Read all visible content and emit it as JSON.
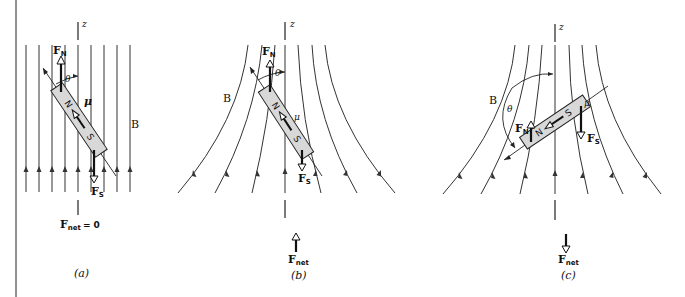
{
  "figure": {
    "panels": [
      {
        "id": "a",
        "caption": "(a)",
        "axis_label": "z",
        "field_label": "B",
        "moment_label": "μ",
        "angle_label": "θ",
        "north_label": "N",
        "south_label": "S",
        "force_north": {
          "main": "F",
          "sub": "N"
        },
        "force_south": {
          "main": "F",
          "sub": "S"
        },
        "net_force": {
          "main": "F",
          "sub": "net",
          "suffix": "= 0"
        },
        "field_type": "uniform"
      },
      {
        "id": "b",
        "caption": "(b)",
        "axis_label": "z",
        "field_label": "B",
        "moment_label": "μ",
        "angle_label": "θ",
        "north_label": "N",
        "south_label": "S",
        "force_north": {
          "main": "F",
          "sub": "N"
        },
        "force_south": {
          "main": "F",
          "sub": "S"
        },
        "net_force": {
          "main": "F",
          "sub": "net",
          "direction": "up"
        },
        "field_type": "diverging"
      },
      {
        "id": "c",
        "caption": "(c)",
        "axis_label": "z",
        "field_label": "B",
        "moment_label": "μ",
        "angle_label": "θ",
        "north_label": "N",
        "south_label": "S",
        "force_north": {
          "main": "F",
          "sub": "N"
        },
        "force_south": {
          "main": "F",
          "sub": "S"
        },
        "net_force": {
          "main": "F",
          "sub": "net",
          "direction": "down"
        },
        "field_type": "diverging"
      }
    ]
  }
}
